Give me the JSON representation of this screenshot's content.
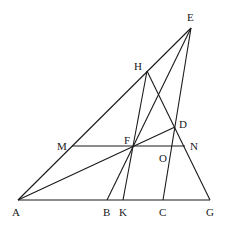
{
  "diagram": {
    "type": "geometry-figure",
    "points": {
      "A": {
        "x": 18,
        "y": 200,
        "label": "A",
        "lx": 12,
        "ly": 216
      },
      "B": {
        "x": 107,
        "y": 200,
        "label": "B",
        "lx": 103,
        "ly": 216
      },
      "K": {
        "x": 123,
        "y": 200,
        "label": "K",
        "lx": 119,
        "ly": 216
      },
      "C": {
        "x": 163,
        "y": 200,
        "label": "C",
        "lx": 159,
        "ly": 216
      },
      "G": {
        "x": 210,
        "y": 200,
        "label": "G",
        "lx": 206,
        "ly": 216
      },
      "E": {
        "x": 191,
        "y": 28,
        "label": "E",
        "lx": 187,
        "ly": 21
      },
      "H": {
        "x": 147,
        "y": 71,
        "label": "H",
        "lx": 134,
        "ly": 70
      },
      "D": {
        "x": 175,
        "y": 127,
        "label": "D",
        "lx": 179,
        "ly": 128
      },
      "M": {
        "x": 72,
        "y": 146,
        "label": "M",
        "lx": 57,
        "ly": 150
      },
      "F": {
        "x": 133,
        "y": 146,
        "label": "F",
        "lx": 124,
        "ly": 144
      },
      "N": {
        "x": 185,
        "y": 146,
        "label": "N",
        "lx": 190,
        "ly": 150
      },
      "O": {
        "x": 171,
        "y": 146,
        "label": "O",
        "lx": 159,
        "ly": 162
      }
    },
    "segments": [
      [
        "A",
        "G"
      ],
      [
        "A",
        "E"
      ],
      [
        "E",
        "C"
      ],
      [
        "E",
        "B"
      ],
      [
        "H",
        "G"
      ],
      [
        "H",
        "K"
      ],
      [
        "A",
        "D"
      ],
      [
        "M",
        "N"
      ]
    ]
  }
}
